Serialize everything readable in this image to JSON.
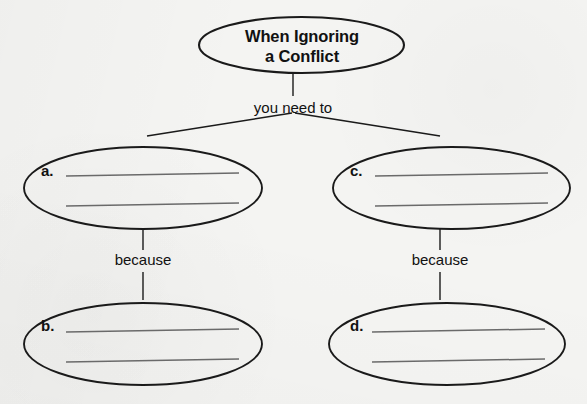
{
  "worksheet": {
    "title": "When Ignoring a Conflict",
    "title_line_1": "When Ignoring",
    "title_line_2": "a Conflict",
    "prompt": "you need to",
    "because_left": "because",
    "because_right": "because",
    "letters": {
      "a": "a.",
      "b": "b.",
      "c": "c.",
      "d": "d."
    },
    "colors": {
      "background": "#f4f4f2",
      "ink": "#1a1a1a",
      "writing_line": "#6a6a6a"
    },
    "blank_lines_per_ellipse": 2,
    "answer_values": {
      "a": "",
      "b": "",
      "c": "",
      "d": ""
    }
  }
}
